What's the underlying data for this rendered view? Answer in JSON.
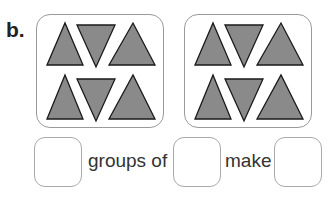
{
  "question": {
    "label": "b.",
    "groups": [
      {
        "triangles": [
          "up",
          "down",
          "up",
          "up",
          "down",
          "up"
        ]
      },
      {
        "triangles": [
          "up",
          "down",
          "up",
          "up",
          "down",
          "up"
        ]
      }
    ],
    "sentence": {
      "word1": "groups of",
      "word2": "make"
    },
    "answers": [
      "",
      "",
      ""
    ]
  },
  "colors": {
    "triangle_fill": "#8a8a8a",
    "triangle_stroke": "#1a1a1a",
    "box_border": "#9a9a9a"
  }
}
